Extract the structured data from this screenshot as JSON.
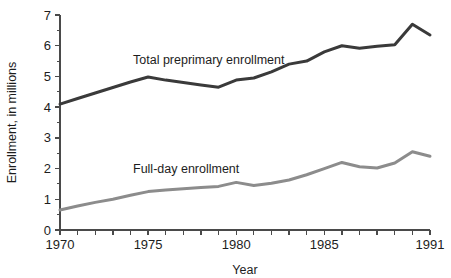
{
  "chart_data": {
    "type": "line",
    "title": "",
    "xlabel": "Year",
    "ylabel": "Enrollment, in millions",
    "xlim": [
      1970,
      1991
    ],
    "ylim": [
      0,
      7
    ],
    "grid": false,
    "legend_position": "inline-annotation",
    "y_ticks": [
      0,
      1,
      2,
      3,
      4,
      5,
      6,
      7
    ],
    "y_tick_labels": [
      "0",
      "1",
      "2",
      "3",
      "4",
      "5",
      "6",
      "7"
    ],
    "y_minor_ticks": [
      0.5,
      1.5,
      2.5,
      3.5,
      4.5,
      5.5,
      6.5
    ],
    "x_ticks": [
      1970,
      1971,
      1972,
      1973,
      1974,
      1975,
      1976,
      1977,
      1978,
      1979,
      1980,
      1981,
      1982,
      1983,
      1984,
      1985,
      1986,
      1987,
      1988,
      1989,
      1990,
      1991
    ],
    "x_tick_labels": [
      {
        "value": 1970,
        "label": "1970"
      },
      {
        "value": 1975,
        "label": "1975"
      },
      {
        "value": 1980,
        "label": "1980"
      },
      {
        "value": 1985,
        "label": "1985"
      },
      {
        "value": 1991,
        "label": "1991"
      }
    ],
    "x": [
      1970,
      1971,
      1972,
      1973,
      1974,
      1975,
      1976,
      1977,
      1978,
      1979,
      1980,
      1981,
      1982,
      1983,
      1984,
      1985,
      1986,
      1987,
      1988,
      1989,
      1990,
      1991
    ],
    "series": [
      {
        "name": "Total preprimary enrollment",
        "color": "#3a3a3a",
        "width": 3.0,
        "values": [
          4.1,
          4.28,
          4.46,
          4.64,
          4.82,
          4.98,
          4.88,
          4.8,
          4.72,
          4.65,
          4.88,
          4.95,
          5.15,
          5.4,
          5.5,
          5.8,
          6.0,
          5.92,
          5.98,
          6.03,
          6.7,
          6.35
        ]
      },
      {
        "name": "Full-day enrollment",
        "color": "#8c8c8c",
        "width": 3.0,
        "values": [
          0.65,
          0.78,
          0.9,
          1.0,
          1.13,
          1.25,
          1.3,
          1.34,
          1.38,
          1.42,
          1.55,
          1.45,
          1.52,
          1.63,
          1.8,
          2.0,
          2.2,
          2.06,
          2.02,
          2.18,
          2.55,
          2.4
        ]
      }
    ],
    "annotations": [
      {
        "text": "Total preprimary enrollment",
        "x_px": 133,
        "y_px": 64
      },
      {
        "text": "Full-day enrollment",
        "x_px": 133,
        "y_px": 173
      }
    ]
  },
  "layout": {
    "plot_left": 60,
    "plot_right": 430,
    "plot_top": 15,
    "plot_bottom": 230
  }
}
